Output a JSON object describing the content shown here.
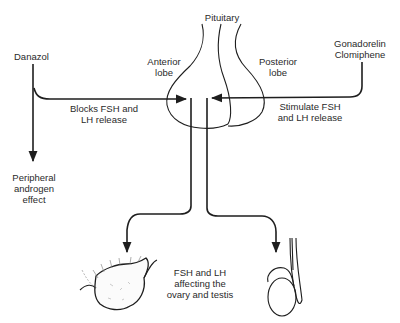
{
  "title": "Pituitary",
  "labels": {
    "pituitary": "Pituitary",
    "anterior_lobe": "Anterior\nlobe",
    "posterior_lobe": "Posterior\nlobe",
    "danazol": "Danazol",
    "gonadorelin_clomiphene": "Gonadorelin\nClomiphene",
    "blocks": "Blocks FSH and\nLH release",
    "stimulate": "Stimulate FSH\nand LH release",
    "peripheral": "Peripheral\nandrogen\neffect",
    "fsh_lh_effect": "FSH and LH\naffecting the\novary and testis"
  },
  "colors": {
    "line": "#1e1e1e",
    "text": "#2a2a2a",
    "background": "#ffffff"
  },
  "nodes": [
    {
      "id": "danazol",
      "kind": "drug"
    },
    {
      "id": "gonadorelin_clomiphene",
      "kind": "drug"
    },
    {
      "id": "pituitary",
      "kind": "organ",
      "parts": [
        "anterior_lobe",
        "posterior_lobe"
      ]
    },
    {
      "id": "ovary",
      "kind": "organ"
    },
    {
      "id": "testis",
      "kind": "organ"
    },
    {
      "id": "peripheral",
      "kind": "effect"
    }
  ],
  "edges": [
    {
      "from": "danazol",
      "to": "pituitary",
      "label": "Blocks FSH and LH release"
    },
    {
      "from": "gonadorelin_clomiphene",
      "to": "pituitary",
      "label": "Stimulate FSH and LH release"
    },
    {
      "from": "danazol",
      "to": "peripheral",
      "label": ""
    },
    {
      "from": "pituitary",
      "to": "ovary",
      "label": "FSH and LH affecting the ovary and testis"
    },
    {
      "from": "pituitary",
      "to": "testis",
      "label": "FSH and LH affecting the ovary and testis"
    }
  ]
}
